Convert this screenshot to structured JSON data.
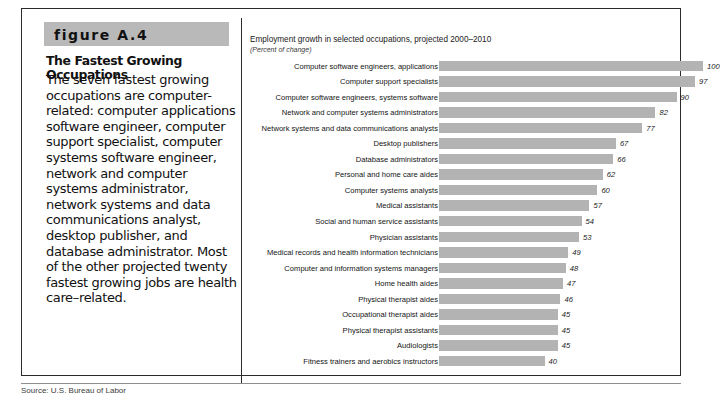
{
  "figure": {
    "banner_label": "figure A.4",
    "heading": "The Fastest Growing Occupations",
    "body": "The seven fastest growing occupations are computer-related: computer applications software engineer, computer support specialist, computer systems software engineer, network and computer systems administrator, network systems and data communications analyst, desktop publisher, and database administrator. Most of the other projected twenty fastest growing jobs are health care–related.",
    "caption": "Source: U.S. Bureau of Labor"
  },
  "colors": {
    "bar_fill": "#b3b3b3",
    "banner_background": "#b9b9b9",
    "frame_border": "#2b2b2b",
    "text": "#141414"
  },
  "chart_data": {
    "type": "bar",
    "orientation": "horizontal",
    "title": "Employment growth in selected occupations, projected 2000–2010",
    "subtitle": "(Percent of change)",
    "xlabel": "",
    "ylabel": "",
    "xlim": [
      0,
      100
    ],
    "grid": false,
    "legend": "none",
    "value_labels": true,
    "categories": [
      "Computer software engineers, applications",
      "Computer support specialists",
      "Computer software engineers, systems software",
      "Network and computer systems administrators",
      "Network systems and data communications analysts",
      "Desktop publishers",
      "Database administrators",
      "Personal and home care aides",
      "Computer systems analysts",
      "Medical assistants",
      "Social and human service assistants",
      "Physician assistants",
      "Medical records and health information technicians",
      "Computer and information systems managers",
      "Home health aides",
      "Physical therapist aides",
      "Occupational therapist aides",
      "Physical therapist assistants",
      "Audiologists",
      "Fitness trainers and aerobics instructors"
    ],
    "values": [
      100,
      97,
      90,
      82,
      77,
      67,
      66,
      62,
      60,
      57,
      54,
      53,
      49,
      48,
      47,
      46,
      45,
      45,
      45,
      40
    ]
  }
}
